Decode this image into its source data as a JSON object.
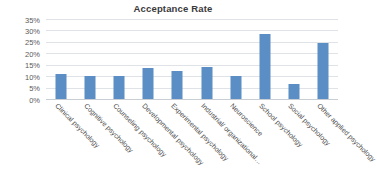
{
  "chart_data": {
    "type": "bar",
    "title": "Acceptance Rate",
    "xlabel": "",
    "ylabel": "",
    "ylim": [
      0,
      35
    ],
    "ytick_step": 5,
    "ytick_labels": [
      "0%",
      "5%",
      "10%",
      "15%",
      "20%",
      "25%",
      "30%",
      "35%"
    ],
    "ytick_values": [
      0,
      5,
      10,
      15,
      20,
      25,
      30,
      35
    ],
    "grid": true,
    "legend": false,
    "bar_color": "#5b8ec4",
    "categories": [
      "Clinical psychology",
      "Cognitive psychology",
      "Counseling psychology",
      "Developmental psychology",
      "Experimental psychology",
      "Industrial/ organizational…",
      "Neuroscience",
      "School psychology",
      "Social psychology",
      "Other applied psychology"
    ],
    "values": [
      11.5,
      10.5,
      10.5,
      14,
      12.5,
      14.5,
      10.5,
      29,
      7,
      25
    ]
  }
}
